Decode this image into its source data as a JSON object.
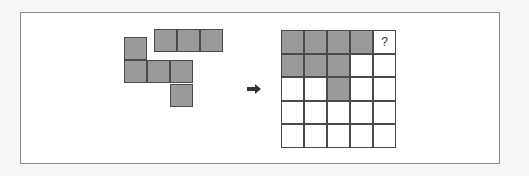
{
  "puzzle": {
    "pieces": [
      {
        "name": "straight-three",
        "cells": [
          [
            0,
            0
          ],
          [
            0,
            1
          ],
          [
            0,
            2
          ]
        ]
      },
      {
        "name": "four-plus-one",
        "cells": [
          [
            0,
            0
          ],
          [
            1,
            0
          ],
          [
            1,
            1
          ],
          [
            1,
            2
          ],
          [
            2,
            2
          ]
        ]
      }
    ],
    "arrow": "right-arrow",
    "grid": {
      "rows": 5,
      "cols": 5,
      "filled": [
        [
          0,
          0
        ],
        [
          0,
          1
        ],
        [
          0,
          2
        ],
        [
          0,
          3
        ],
        [
          1,
          0
        ],
        [
          1,
          1
        ],
        [
          1,
          2
        ],
        [
          2,
          2
        ]
      ],
      "question_cell": [
        0,
        4
      ],
      "question_mark": "?"
    },
    "colors": {
      "filled": "#9a9a9a",
      "border": "#4a4a4a",
      "frame": "#8a8a8a"
    }
  }
}
